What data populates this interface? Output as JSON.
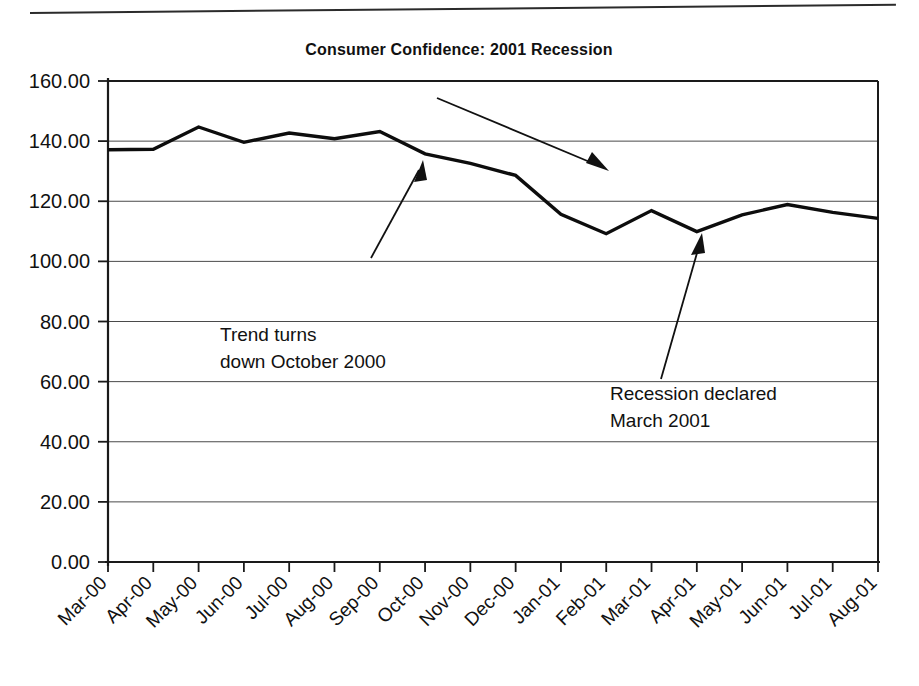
{
  "chart_data": {
    "type": "line",
    "title": "Consumer Confidence: 2001 Recession",
    "xlabel": "",
    "ylabel": "",
    "grid": true,
    "legend": "none",
    "ylim": [
      0,
      160
    ],
    "ytick_step": 20,
    "ytick_labels": [
      "0.00",
      "20.00",
      "40.00",
      "60.00",
      "80.00",
      "100.00",
      "120.00",
      "140.00",
      "160.00"
    ],
    "categories": [
      "Mar-00",
      "Apr-00",
      "May-00",
      "Jun-00",
      "Jul-00",
      "Aug-00",
      "Sep-00",
      "Oct-00",
      "Nov-00",
      "Dec-00",
      "Jan-01",
      "Feb-01",
      "Mar-01",
      "Apr-01",
      "May-01",
      "Jun-01",
      "Jul-01",
      "Aug-01"
    ],
    "series": [
      {
        "name": "Consumer Confidence Index",
        "values": [
          137.1,
          137.3,
          144.7,
          139.6,
          142.7,
          140.8,
          143.2,
          135.8,
          132.6,
          128.6,
          115.7,
          109.2,
          116.9,
          109.9,
          115.5,
          118.9,
          116.3,
          114.3
        ]
      }
    ],
    "annotations": [
      {
        "name": "trend-down-annotation",
        "lines": [
          "Trend turns",
          "down October 2000"
        ],
        "points_at": "Oct-00"
      },
      {
        "name": "recession-declared-annotation",
        "lines": [
          "Recession declared",
          "March 2001"
        ],
        "points_at": "Apr-01"
      },
      {
        "name": "downward-trend-arrow",
        "lines": [],
        "points_at": ""
      }
    ],
    "colors": {
      "series": "#0d0d0d",
      "grid": "#4a4a4a",
      "axis": "#1a1a1a",
      "background": "#ffffff",
      "text": "#111111"
    }
  }
}
